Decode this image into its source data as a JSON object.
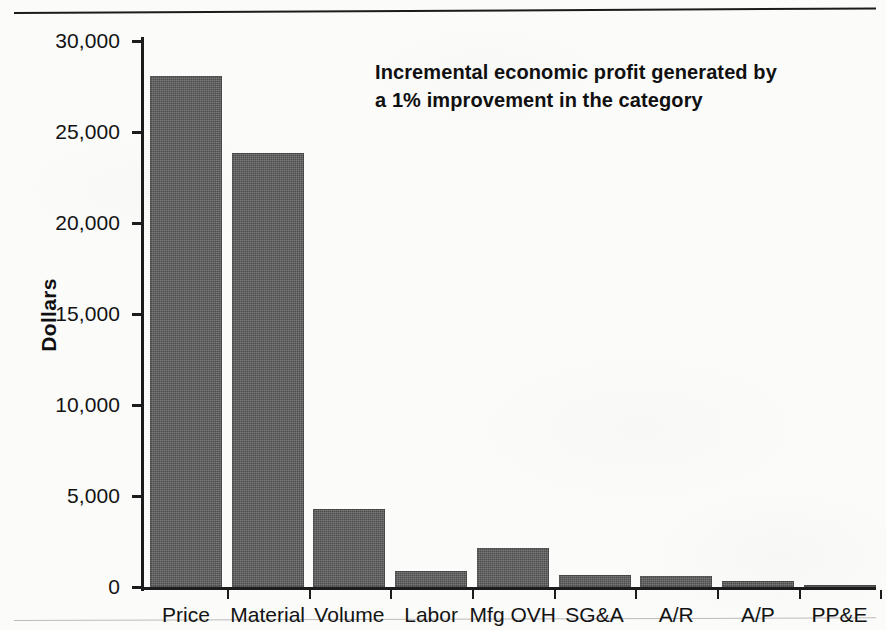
{
  "chart_data": {
    "type": "bar",
    "title": "",
    "annotation_lines": [
      "Incremental economic profit generated by",
      "a 1%  improvement in the category"
    ],
    "xlabel": "",
    "ylabel": "Dollars",
    "ylim": [
      0,
      30000
    ],
    "ytick_values": [
      0,
      5000,
      10000,
      15000,
      20000,
      25000,
      30000
    ],
    "ytick_labels": [
      "0",
      "5,000",
      "10,000",
      "15,000",
      "20,000",
      "25,000",
      "30,000"
    ],
    "grid": false,
    "legend": "none",
    "bar_color": "#585858",
    "categories": [
      "Price",
      "Material",
      "Volume",
      "Labor",
      "Mfg OVH",
      "SG&A",
      "A/R",
      "A/P",
      "PP&E"
    ],
    "values": [
      28100,
      23850,
      4280,
      900,
      2150,
      650,
      620,
      330,
      110
    ]
  },
  "figure": {
    "background_color": "#fbfbfa",
    "axis_color": "#1c1c1c",
    "text_color": "#131313"
  }
}
